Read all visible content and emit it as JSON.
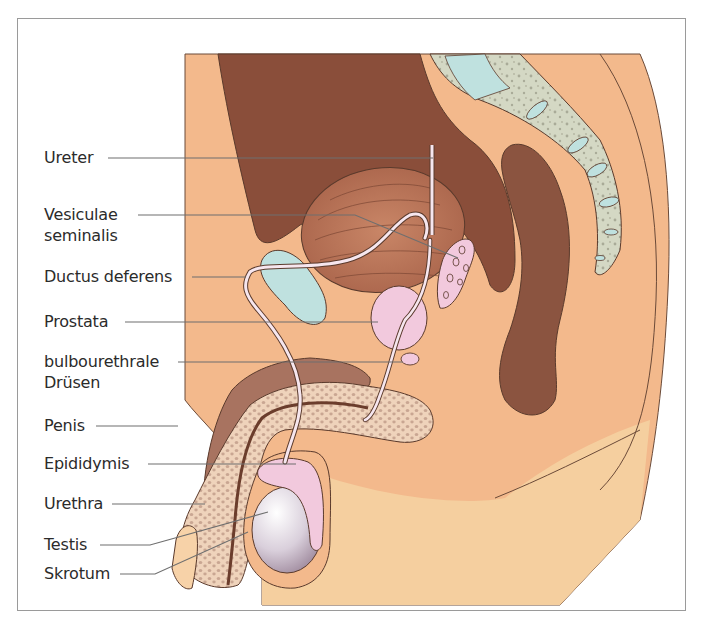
{
  "figure": {
    "type": "anatomical-diagram",
    "colors": {
      "skin": "#f3b98c",
      "skin_light": "#f7d2a8",
      "thigh": "#f5cf9f",
      "rectum_cavity": "#8a4e3a",
      "bowel": "#8b5440",
      "bladder": "#b87558",
      "pubic_bone": "#bfe1df",
      "prostate": "#f2c9dd",
      "spongy_tissue": "#efd3bb",
      "spongy_dots": "#c9a692",
      "testis": "#d9cfdb",
      "sacrum": "#d4d8c4",
      "outline": "#5a3a2c",
      "leader": "#6f6f6f"
    }
  },
  "labels": [
    {
      "id": "ureter",
      "lines": [
        "Ureter"
      ]
    },
    {
      "id": "vesiculae",
      "lines": [
        "Vesiculae",
        "seminalis"
      ]
    },
    {
      "id": "ductus",
      "lines": [
        "Ductus deferens"
      ]
    },
    {
      "id": "prostata",
      "lines": [
        "Prostata"
      ]
    },
    {
      "id": "bulbo",
      "lines": [
        "bulbourethrale",
        "Drüsen"
      ]
    },
    {
      "id": "penis",
      "lines": [
        "Penis"
      ]
    },
    {
      "id": "epididymis",
      "lines": [
        "Epididymis"
      ]
    },
    {
      "id": "urethra",
      "lines": [
        "Urethra"
      ]
    },
    {
      "id": "testis",
      "lines": [
        "Testis"
      ]
    },
    {
      "id": "skrotum",
      "lines": [
        "Skrotum"
      ]
    }
  ]
}
